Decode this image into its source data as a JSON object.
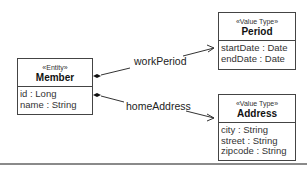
{
  "diagram": {
    "type": "UML class diagram",
    "classes": [
      {
        "id": "member",
        "stereotype": "«Entity»",
        "name": "Member",
        "attributes": [
          "id : Long",
          "name : String"
        ]
      },
      {
        "id": "period",
        "stereotype": "«Value Type»",
        "name": "Period",
        "attributes": [
          "startDate : Date",
          "endDate : Date"
        ]
      },
      {
        "id": "address",
        "stereotype": "«Value Type»",
        "name": "Address",
        "attributes": [
          "city : String",
          "street : String",
          "zipcode : String"
        ]
      }
    ],
    "associations": [
      {
        "from": "Member",
        "to": "Period",
        "kind": "composition",
        "label": "workPeriod"
      },
      {
        "from": "Member",
        "to": "Address",
        "kind": "composition",
        "label": "homeAddress"
      }
    ],
    "colors": {
      "line": "#444444",
      "text": "#222222",
      "background": "#ffffff",
      "rule": "#8a8a8a"
    }
  }
}
